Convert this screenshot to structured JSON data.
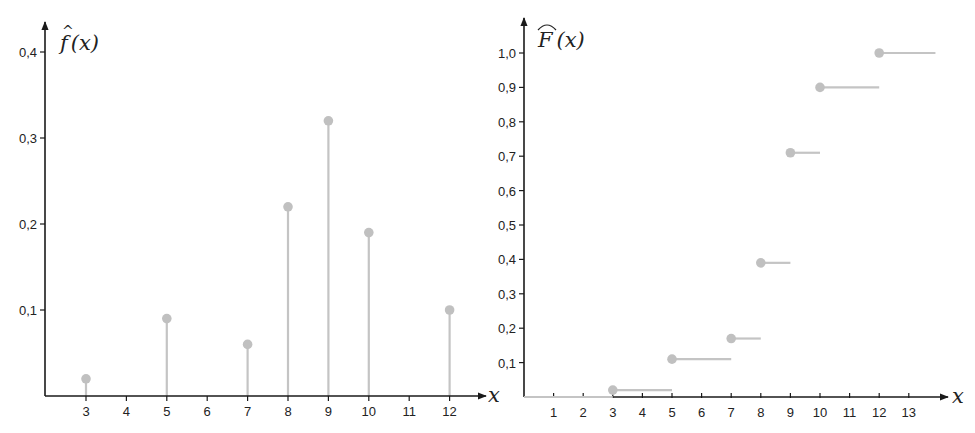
{
  "colors": {
    "axis": "#1a1a1a",
    "stem": "#c4c4c4",
    "dot": "#c0c0c0",
    "text": "#222222",
    "background": "#ffffff"
  },
  "chart_data": [
    {
      "type": "stem",
      "title": "",
      "ylabel": "f̂(x)",
      "xlabel": "x",
      "x_ticks": [
        3,
        4,
        5,
        6,
        7,
        8,
        9,
        10,
        11,
        12
      ],
      "y_ticks": [
        0.1,
        0.2,
        0.3,
        0.4
      ],
      "y_tick_labels": [
        "0,1",
        "0,2",
        "0,3",
        "0,4"
      ],
      "ylim": [
        0,
        0.43
      ],
      "grid": false,
      "x": [
        3,
        5,
        7,
        8,
        9,
        10,
        12
      ],
      "values": [
        0.02,
        0.09,
        0.06,
        0.22,
        0.32,
        0.19,
        0.1
      ]
    },
    {
      "type": "step",
      "title": "",
      "ylabel": "F̂(x)",
      "xlabel": "x",
      "x_ticks": [
        1,
        2,
        3,
        4,
        5,
        6,
        7,
        8,
        9,
        10,
        11,
        12,
        13
      ],
      "y_ticks": [
        0.1,
        0.2,
        0.3,
        0.4,
        0.5,
        0.6,
        0.7,
        0.8,
        0.9,
        1.0
      ],
      "y_tick_labels": [
        "0,1",
        "0,2",
        "0,3",
        "0,4",
        "0,5",
        "0,6",
        "0,7",
        "0,8",
        "0,9",
        "1,0"
      ],
      "ylim": [
        0,
        1.05
      ],
      "grid": false,
      "steps": [
        {
          "x_start": 0,
          "x_end": 3,
          "value": 0.0,
          "dot": false
        },
        {
          "x_start": 3,
          "x_end": 5,
          "value": 0.02,
          "dot": true
        },
        {
          "x_start": 5,
          "x_end": 7,
          "value": 0.11,
          "dot": true
        },
        {
          "x_start": 7,
          "x_end": 8,
          "value": 0.17,
          "dot": true
        },
        {
          "x_start": 8,
          "x_end": 9,
          "value": 0.39,
          "dot": true
        },
        {
          "x_start": 9,
          "x_end": 10,
          "value": 0.71,
          "dot": true
        },
        {
          "x_start": 10,
          "x_end": 12,
          "value": 0.9,
          "dot": true
        },
        {
          "x_start": 12,
          "x_end": 13.9,
          "value": 1.0,
          "dot": true
        }
      ]
    }
  ],
  "left_chart": {
    "function_label_main": "f",
    "function_label_hat": "^",
    "function_label_arg": "(x)",
    "x_axis_label": "x"
  },
  "right_chart": {
    "function_label_main": "F",
    "function_label_arg": "(x)",
    "x_axis_label": "x"
  }
}
